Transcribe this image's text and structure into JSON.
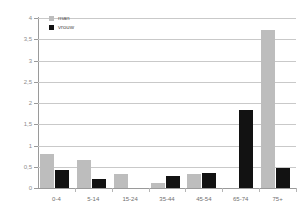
{
  "chart_data": {
    "type": "bar",
    "title": "",
    "xlabel": "",
    "ylabel": "",
    "categories": [
      "0-4",
      "5-14",
      "15-24",
      "35-44",
      "45-54",
      "65-74",
      "75+"
    ],
    "series": [
      {
        "name": "man",
        "color": "#bdbdbd",
        "values": [
          0.79,
          0.67,
          0.32,
          0.11,
          0.33,
          0,
          3.72
        ]
      },
      {
        "name": "vrouw",
        "color": "#121212",
        "values": [
          0.43,
          0.22,
          0,
          0.29,
          0.35,
          1.83,
          0.46
        ]
      }
    ],
    "ylim": [
      0,
      4
    ],
    "yticks": [
      0,
      0.5,
      1,
      1.5,
      2,
      2.5,
      3,
      3.5,
      4
    ],
    "ytick_labels": [
      "0",
      "0,5",
      "1",
      "1,5",
      "2",
      "2,5",
      "3",
      "3,5",
      "4"
    ],
    "grid": true,
    "legend_position": "top-left"
  },
  "legend": {
    "entries": [
      {
        "label": "man",
        "swatch": "man-swatch"
      },
      {
        "label": "vrouw",
        "swatch": "vrouw-swatch"
      }
    ]
  }
}
